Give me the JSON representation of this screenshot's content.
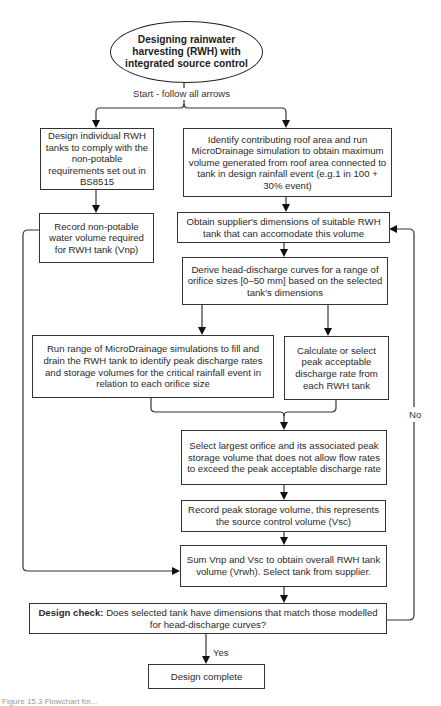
{
  "start_node": {
    "text": "Designing rainwater harvesting (RWH) with integrated source control"
  },
  "start_label": "Start - follow all arrows",
  "nodes": {
    "design_individual": "Design individual RWH tanks to comply with the non-potable requirements set out in BS8515",
    "identify_roof": "Identify contributing roof area and run MicroDrainage simulation to obtain maximum volume generated from roof area connected to tank in design rainfall event (e.g.1 in 100 + 30% event)",
    "record_nonpotable": "Record non-potable water volume required for RWH tank (Vnp)",
    "obtain_supplier": "Obtain supplier's dimensions of suitable RWH tank that can accomodate this volume",
    "derive_curves": "Derive head-discharge curves for a range of orifice sizes [0–50 mm] based on the selected tank's dimensions",
    "run_range": "Run range of MicroDrainage simulations to fill and drain the RWH tank to identify peak discharge rates and storage volumes for the critical rainfall event in relation to each orifice size",
    "calculate_peak": "Calculate or select peak acceptable discharge rate from each RWH tank",
    "select_largest": "Select largest orifice and its associated peak storage volume that does not allow flow rates to exceed the peak acceptable discharge rate",
    "record_peak": "Record peak storage volume, this represents the source control volume (Vsc)",
    "sum_volumes": "Sum Vnp and Vsc to obtain overall RWH tank volume (Vrwh). Select tank from supplier.",
    "design_check_bold": "Design check:",
    "design_check": " Does selected tank have dimensions that match those modelled for head-discharge curves?",
    "design_complete": "Design complete"
  },
  "edge_labels": {
    "yes": "Yes",
    "no": "No"
  },
  "caption": "Figure 15.3  Flowchart for..."
}
